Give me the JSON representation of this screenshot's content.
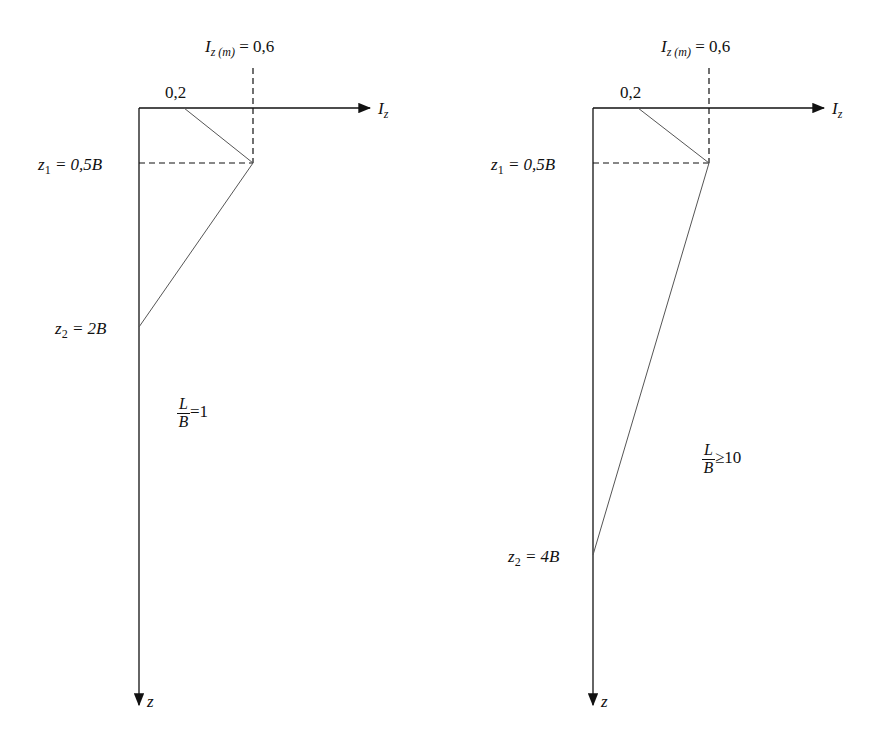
{
  "left_panel": {
    "peak_label_main": "I",
    "peak_label_sub": "z (m)",
    "peak_label_value": "= 0,6",
    "start_value": "0,2",
    "x_axis_label_main": "I",
    "x_axis_label_sub": "z",
    "z1_main": "z",
    "z1_sub": "1",
    "z1_value": "= 0,5B",
    "z2_main": "z",
    "z2_sub": "2",
    "z2_value": "= 2B",
    "ratio_num": "L",
    "ratio_den": "B",
    "ratio_rel": "=1",
    "z_axis_label": "z"
  },
  "right_panel": {
    "peak_label_main": "I",
    "peak_label_sub": "z (m)",
    "peak_label_value": "= 0,6",
    "start_value": "0,2",
    "x_axis_label_main": "I",
    "x_axis_label_sub": "z",
    "z1_main": "z",
    "z1_sub": "1",
    "z1_value": "= 0,5B",
    "z2_main": "z",
    "z2_sub": "2",
    "z2_value": "= 4B",
    "ratio_num": "L",
    "ratio_den": "B",
    "ratio_rel": "≥10",
    "z_axis_label": "z"
  },
  "colors": {
    "axis": "#111111",
    "curve": "#555555"
  }
}
